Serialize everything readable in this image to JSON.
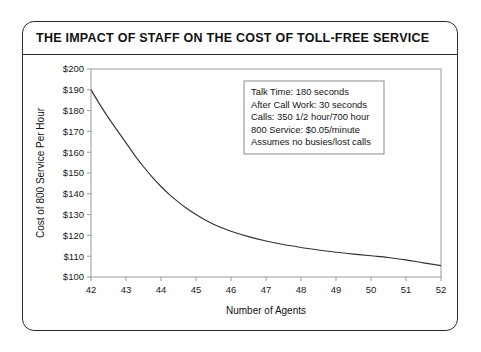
{
  "figure": {
    "title": "THE IMPACT OF STAFF ON THE COST OF TOLL-FREE SERVICE",
    "frame_color": "#2b2b2b",
    "background_color": "#ffffff"
  },
  "annotation": {
    "lines": [
      "Talk Time: 180 seconds",
      "After Call Work: 30 seconds",
      "Calls: 350 1/2 hour/700 hour",
      "800 Service: $0.05/minute",
      "Assumes no busies/lost calls"
    ],
    "border_color": "#8a8a8a"
  },
  "chart_data": {
    "type": "line",
    "title": "THE IMPACT OF STAFF ON THE COST OF TOLL-FREE SERVICE",
    "xlabel": "Number of Agents",
    "ylabel": "Cost of 800 Service Per Hour",
    "xlim": [
      42,
      52
    ],
    "ylim": [
      100,
      200
    ],
    "grid": false,
    "legend": "none",
    "line_color": "#333333",
    "xticks": [
      42,
      43,
      44,
      45,
      46,
      47,
      48,
      49,
      50,
      51,
      52
    ],
    "xtick_labels": [
      "42",
      "43",
      "44",
      "45",
      "46",
      "47",
      "48",
      "49",
      "50",
      "51",
      "52"
    ],
    "yticks": [
      100,
      110,
      120,
      130,
      140,
      150,
      160,
      170,
      180,
      190,
      200
    ],
    "ytick_labels": [
      "$100",
      "$110",
      "$120",
      "$130",
      "$140",
      "$150",
      "$160",
      "$170",
      "$180",
      "$190",
      "$200"
    ],
    "series": [
      {
        "name": "Cost of 800 Service Per Hour",
        "x": [
          42,
          42.25,
          42.5,
          42.75,
          43,
          43.25,
          43.5,
          43.75,
          44,
          44.25,
          44.5,
          44.75,
          45,
          45.25,
          45.5,
          45.75,
          46,
          46.5,
          47,
          47.5,
          48,
          48.5,
          49,
          49.5,
          50,
          50.5,
          51,
          51.5,
          52
        ],
        "values": [
          190.0,
          183.0,
          176.5,
          170.5,
          164.5,
          158.5,
          153.0,
          148.0,
          143.5,
          139.5,
          136.0,
          132.8,
          130.0,
          127.5,
          125.4,
          123.6,
          122.0,
          119.4,
          117.3,
          115.6,
          114.2,
          113.0,
          111.9,
          111.0,
          110.2,
          109.4,
          108.2,
          106.8,
          105.5
        ]
      }
    ]
  },
  "axis": {
    "x_title": "Number of Agents",
    "y_title": "Cost of 800 Service Per Hour"
  }
}
